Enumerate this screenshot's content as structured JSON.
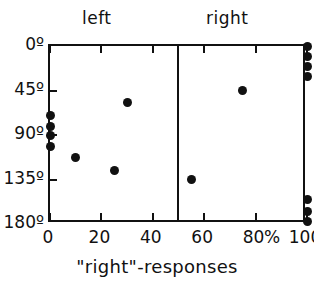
{
  "chart_data": {
    "type": "scatter",
    "title": "",
    "xlabel": "\"right\"-responses",
    "ylabel": "",
    "xlim": [
      0,
      100
    ],
    "ylim": [
      0,
      180
    ],
    "y_inverted": true,
    "grid": false,
    "legend": "none",
    "x_unit": "%",
    "x_ticks": [
      {
        "value": 0,
        "label": "0"
      },
      {
        "value": 20,
        "label": "20"
      },
      {
        "value": 40,
        "label": "40"
      },
      {
        "value": 60,
        "label": "60"
      },
      {
        "value": 80,
        "label": "80"
      },
      {
        "value": 100,
        "label": "100"
      }
    ],
    "y_ticks": [
      {
        "value": 0,
        "label": "0º"
      },
      {
        "value": 45,
        "label": "45º"
      },
      {
        "value": 90,
        "label": "90º"
      },
      {
        "value": 135,
        "label": "135º"
      },
      {
        "value": 180,
        "label": "180º"
      }
    ],
    "divider_at_x": 50,
    "panels": [
      {
        "name": "left",
        "label": "left",
        "points": [
          {
            "x": 0,
            "y": 70
          },
          {
            "x": 0,
            "y": 81
          },
          {
            "x": 0,
            "y": 91
          },
          {
            "x": 0,
            "y": 102
          },
          {
            "x": 10,
            "y": 113
          },
          {
            "x": 25,
            "y": 126
          },
          {
            "x": 30,
            "y": 57
          }
        ]
      },
      {
        "name": "right",
        "label": "right",
        "points": [
          {
            "x": 55,
            "y": 135
          },
          {
            "x": 75,
            "y": 45
          },
          {
            "x": 100,
            "y": 1
          },
          {
            "x": 100,
            "y": 11
          },
          {
            "x": 100,
            "y": 21
          },
          {
            "x": 100,
            "y": 31
          },
          {
            "x": 100,
            "y": 155
          },
          {
            "x": 100,
            "y": 167
          },
          {
            "x": 100,
            "y": 177
          }
        ]
      }
    ]
  },
  "figure": {
    "panel_left_label": "left",
    "panel_right_label": "right",
    "percent_sign": "%",
    "axis_caption": "\"right\"-responses"
  },
  "colors": {
    "ink": "#111111",
    "background": "#ffffff",
    "marker": "#111111"
  }
}
